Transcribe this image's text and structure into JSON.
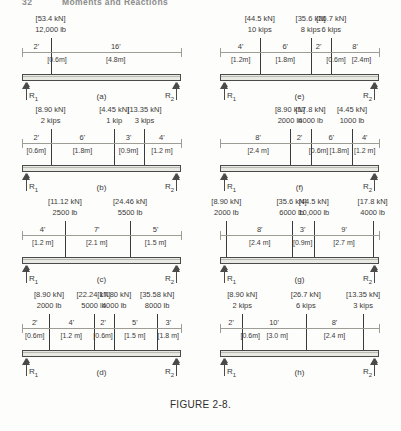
{
  "running_head": {
    "page_number": "32",
    "title": "Moments and Reactions"
  },
  "figure_caption": "FIGURE 2-8.",
  "labels": {
    "reaction_left": "R",
    "reaction_left_sub": "1",
    "reaction_right": "R",
    "reaction_right_sub": "2"
  },
  "panels": [
    {
      "id": "a",
      "caption": "(a)",
      "loads": [
        {
          "kn": "[53.4 kN]",
          "imperial": "12,000 lb",
          "x_pct": 18
        }
      ],
      "dims_ft": [
        {
          "text": "2'",
          "x_pct": 9
        },
        {
          "text": "16'",
          "x_pct": 59
        }
      ],
      "dims_m": [
        {
          "text": "[0.6m]",
          "x_pct": 22
        },
        {
          "text": "[4.8m]",
          "x_pct": 59
        }
      ]
    },
    {
      "id": "e",
      "caption": "(e)",
      "loads": [
        {
          "kn": "[44.5 kN]",
          "imperial": "10 kips",
          "x_pct": 25
        },
        {
          "kn": "[35.6 kN]",
          "imperial": "8 kips",
          "x_pct": 57
        },
        {
          "kn": "[26.7 kN]",
          "imperial": "6 kips",
          "x_pct": 70
        }
      ],
      "dims_ft": [
        {
          "text": "4'",
          "x_pct": 13
        },
        {
          "text": "6'",
          "x_pct": 41
        },
        {
          "text": "2'",
          "x_pct": 62
        },
        {
          "text": "8'",
          "x_pct": 85
        }
      ],
      "dims_m": [
        {
          "text": "[1.2m]",
          "x_pct": 13
        },
        {
          "text": "[1.8m]",
          "x_pct": 41
        },
        {
          "text": "[0.6m]",
          "x_pct": 73
        },
        {
          "text": "[2.4m]",
          "x_pct": 89
        }
      ]
    },
    {
      "id": "b",
      "caption": "(b)",
      "loads": [
        {
          "kn": "[8.90 kN]",
          "imperial": "2 kips",
          "x_pct": 18
        },
        {
          "kn": "[4.45 kN]",
          "imperial": "1 kip",
          "x_pct": 58
        },
        {
          "kn": "[13.35 kN]",
          "imperial": "3 kips",
          "x_pct": 77
        }
      ],
      "dims_ft": [
        {
          "text": "2'",
          "x_pct": 9
        },
        {
          "text": "6'",
          "x_pct": 38
        },
        {
          "text": "3'",
          "x_pct": 67
        },
        {
          "text": "4'",
          "x_pct": 88
        }
      ],
      "dims_m": [
        {
          "text": "[0.6m]",
          "x_pct": 9
        },
        {
          "text": "[1.8m]",
          "x_pct": 38
        },
        {
          "text": "[0.9m]",
          "x_pct": 67
        },
        {
          "text": "[1.2 m]",
          "x_pct": 88
        }
      ]
    },
    {
      "id": "f",
      "caption": "(f)",
      "loads": [
        {
          "kn": "[8.90 kN]",
          "imperial": "2000 lb",
          "x_pct": 44
        },
        {
          "kn": "[17.8 kN]",
          "imperial": "4000 lb",
          "x_pct": 57
        },
        {
          "kn": "[4.45 kN]",
          "imperial": "1000 lb",
          "x_pct": 83
        }
      ],
      "dims_ft": [
        {
          "text": "8'",
          "x_pct": 24
        },
        {
          "text": "2'",
          "x_pct": 50
        },
        {
          "text": "6'",
          "x_pct": 70
        },
        {
          "text": "4'",
          "x_pct": 91
        }
      ],
      "dims_m": [
        {
          "text": "[2.4 m]",
          "x_pct": 24
        },
        {
          "text": "[0.6m]",
          "x_pct": 62
        },
        {
          "text": "[1.8m]",
          "x_pct": 75
        },
        {
          "text": "[1.2 m]",
          "x_pct": 91
        }
      ]
    },
    {
      "id": "c",
      "caption": "(c)",
      "loads": [
        {
          "kn": "[11.12 kN]",
          "imperial": "2500 lb",
          "x_pct": 27
        },
        {
          "kn": "[24.46 kN]",
          "imperial": "5500 lb",
          "x_pct": 68
        }
      ],
      "dims_ft": [
        {
          "text": "4'",
          "x_pct": 13
        },
        {
          "text": "7'",
          "x_pct": 47
        },
        {
          "text": "5'",
          "x_pct": 84
        }
      ],
      "dims_m": [
        {
          "text": "[1.2 m]",
          "x_pct": 13
        },
        {
          "text": "[2.1 m]",
          "x_pct": 47
        },
        {
          "text": "[1.5 m]",
          "x_pct": 84
        }
      ]
    },
    {
      "id": "g",
      "caption": "(g)",
      "loads": [
        {
          "kn": "[8.90 kN]",
          "imperial": "2000 lb",
          "x_pct": 4
        },
        {
          "kn": "[35.6 kN]",
          "imperial": "6000 lb",
          "x_pct": 45
        },
        {
          "kn": "[44.5 kN]",
          "imperial": "10,000 lb",
          "x_pct": 59
        },
        {
          "kn": "[17.8 kN]",
          "imperial": "4000 lb",
          "x_pct": 96
        }
      ],
      "dims_ft": [
        {
          "text": "8'",
          "x_pct": 25
        },
        {
          "text": "3'",
          "x_pct": 52
        },
        {
          "text": "9'",
          "x_pct": 78
        }
      ],
      "dims_m": [
        {
          "text": "[2.4 m]",
          "x_pct": 25
        },
        {
          "text": "[0.9m]",
          "x_pct": 52
        },
        {
          "text": "[2.7 m]",
          "x_pct": 78
        }
      ]
    },
    {
      "id": "d",
      "caption": "(d)",
      "loads": [
        {
          "kn": "[8.90 kN]",
          "imperial": "2000 lb",
          "x_pct": 17
        },
        {
          "kn": "[22.24 kN]",
          "imperial": "5000 lb",
          "x_pct": 45
        },
        {
          "kn": "[17.80 kN]",
          "imperial": "4000 lb",
          "x_pct": 58
        },
        {
          "kn": "[35.58 kN]",
          "imperial": "8000 lb",
          "x_pct": 85
        }
      ],
      "dims_ft": [
        {
          "text": "2'",
          "x_pct": 8
        },
        {
          "text": "4'",
          "x_pct": 31
        },
        {
          "text": "2'",
          "x_pct": 51
        },
        {
          "text": "5'",
          "x_pct": 71
        },
        {
          "text": "3'",
          "x_pct": 92
        }
      ],
      "dims_m": [
        {
          "text": "[0.6m]",
          "x_pct": 8
        },
        {
          "text": "[1.2 m]",
          "x_pct": 31
        },
        {
          "text": "[0.6m]",
          "x_pct": 51
        },
        {
          "text": "[1.5 m]",
          "x_pct": 71
        },
        {
          "text": "[1.8 m]",
          "x_pct": 92
        }
      ]
    },
    {
      "id": "h",
      "caption": "(h)",
      "loads": [
        {
          "kn": "[8.90 kN]",
          "imperial": "2 kips",
          "x_pct": 14
        },
        {
          "kn": "[26.7 kN]",
          "imperial": "6 kips",
          "x_pct": 54
        },
        {
          "kn": "[13.35 kN]",
          "imperial": "3 kips",
          "x_pct": 90
        }
      ],
      "dims_ft": [
        {
          "text": "2'",
          "x_pct": 7
        },
        {
          "text": "10'",
          "x_pct": 34
        },
        {
          "text": "8'",
          "x_pct": 72
        }
      ],
      "dims_m": [
        {
          "text": "[0.6m]",
          "x_pct": 19
        },
        {
          "text": "[3.0 m]",
          "x_pct": 36
        },
        {
          "text": "[2.4 m]",
          "x_pct": 72
        }
      ]
    }
  ]
}
